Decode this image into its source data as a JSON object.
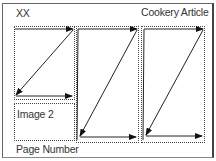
{
  "diagram": {
    "header_left": "XX",
    "header_right": "Cookery Article",
    "image_box_label": "Image 2",
    "footer_left": "Page Number",
    "columns": [
      {
        "name": "column-1",
        "x": 14,
        "y": 26,
        "width": 60,
        "height": 73
      },
      {
        "name": "column-2",
        "x": 76,
        "y": 26,
        "width": 62,
        "height": 116
      },
      {
        "name": "column-3",
        "x": 142,
        "y": 26,
        "width": 63,
        "height": 116
      }
    ],
    "image_box": {
      "x": 14,
      "y": 103,
      "width": 60,
      "height": 38
    },
    "flow_description": "Text flows left-to-right across each column line then diagonally back, continuing from column 1 to column 2 to column 3"
  }
}
